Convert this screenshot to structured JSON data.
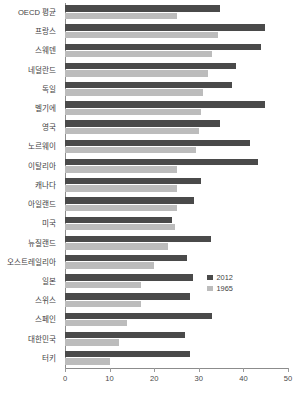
{
  "chart_data": {
    "type": "bar",
    "orientation": "horizontal",
    "title": "",
    "xlabel": "",
    "ylabel": "",
    "xlim": [
      0,
      50
    ],
    "xticks": [
      0,
      10,
      20,
      30,
      40,
      50
    ],
    "grid": false,
    "legend_position": "inside-right",
    "colors": {
      "2012": "#4a4a4a",
      "1965": "#bcbcbc",
      "axis": "#8c8c8c"
    },
    "categories": [
      "OECD 평균",
      "프랑스",
      "스웨덴",
      "네덜란드",
      "독일",
      "벨기에",
      "영국",
      "노르웨이",
      "이탈리아",
      "캐나다",
      "아일랜드",
      "미국",
      "뉴질랜드",
      "오스트레일리아",
      "일본",
      "스위스",
      "스페인",
      "대한민국",
      "터키"
    ],
    "series": [
      {
        "name": "2012",
        "color": "#4a4a4a",
        "values": [
          34.8,
          44.8,
          44.0,
          38.4,
          37.4,
          44.8,
          34.8,
          41.5,
          43.3,
          30.5,
          29.0,
          24.0,
          32.7,
          27.4,
          28.7,
          28.0,
          33.0,
          27.0,
          28.0
        ]
      },
      {
        "name": "1965",
        "color": "#bcbcbc",
        "values": [
          25.0,
          34.3,
          33.0,
          32.0,
          31.0,
          30.5,
          30.0,
          29.4,
          25.0,
          25.0,
          25.0,
          24.7,
          23.0,
          20.0,
          17.0,
          17.0,
          14.0,
          12.0,
          10.0
        ]
      }
    ]
  },
  "legend": {
    "items": [
      {
        "label": "2012"
      },
      {
        "label": "1965"
      }
    ]
  }
}
